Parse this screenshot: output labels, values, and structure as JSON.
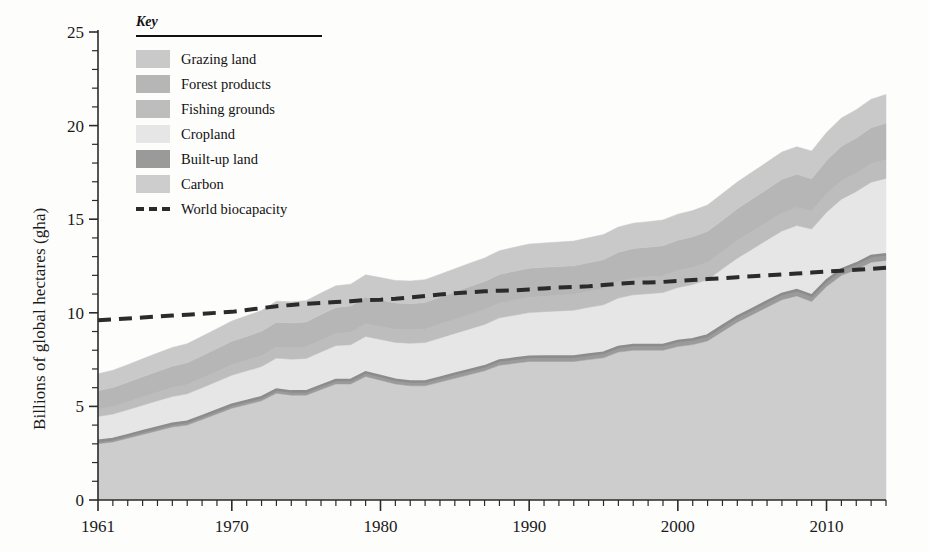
{
  "axes": {
    "ylabel": "Billions of global hectares (gha)",
    "yticks": [
      0,
      5,
      10,
      15,
      20,
      25
    ],
    "xticks": [
      1961,
      1970,
      1980,
      1990,
      2000,
      2010
    ]
  },
  "legend": {
    "title": "Key",
    "entries": [
      {
        "label": "Grazing land",
        "color": "#c9c9c9"
      },
      {
        "label": "Forest products",
        "color": "#b6b6b6"
      },
      {
        "label": "Fishing grounds",
        "color": "#bdbdbd"
      },
      {
        "label": "Cropland",
        "color": "#e6e6e6"
      },
      {
        "label": "Built-up land",
        "color": "#9a9a9a"
      },
      {
        "label": "Carbon",
        "color": "#cdcdcd"
      },
      {
        "label": "World biocapacity",
        "color": "#2b2b2b"
      }
    ]
  },
  "chart_data": {
    "type": "area",
    "title": "",
    "xlabel": "",
    "ylabel": "Billions of global hectares (gha)",
    "xlim": [
      1961,
      2014
    ],
    "ylim": [
      0,
      25
    ],
    "grid": false,
    "legend_position": "top-left",
    "stack_order": [
      "Carbon",
      "Built-up land",
      "Cropland",
      "Fishing grounds",
      "Forest products",
      "Grazing land"
    ],
    "x": [
      1961,
      1962,
      1963,
      1964,
      1965,
      1966,
      1967,
      1968,
      1969,
      1970,
      1971,
      1972,
      1973,
      1974,
      1975,
      1976,
      1977,
      1978,
      1979,
      1980,
      1981,
      1982,
      1983,
      1984,
      1985,
      1986,
      1987,
      1988,
      1989,
      1990,
      1991,
      1992,
      1993,
      1994,
      1995,
      1996,
      1997,
      1998,
      1999,
      2000,
      2001,
      2002,
      2003,
      2004,
      2005,
      2006,
      2007,
      2008,
      2009,
      2010,
      2011,
      2012,
      2013,
      2014
    ],
    "series": [
      {
        "name": "Carbon",
        "color": "#cdcdcd",
        "values": [
          3.0,
          3.1,
          3.3,
          3.5,
          3.7,
          3.9,
          4.0,
          4.3,
          4.6,
          4.9,
          5.1,
          5.3,
          5.7,
          5.6,
          5.6,
          5.9,
          6.2,
          6.2,
          6.6,
          6.4,
          6.2,
          6.1,
          6.1,
          6.3,
          6.5,
          6.7,
          6.9,
          7.2,
          7.3,
          7.4,
          7.4,
          7.4,
          7.4,
          7.5,
          7.6,
          7.9,
          8.0,
          8.0,
          8.0,
          8.2,
          8.3,
          8.5,
          9.0,
          9.5,
          9.9,
          10.3,
          10.7,
          10.9,
          10.6,
          11.4,
          12.0,
          12.3,
          12.7,
          12.8
        ]
      },
      {
        "name": "Built-up land",
        "color": "#9a9a9a",
        "values": [
          0.16,
          0.16,
          0.16,
          0.17,
          0.17,
          0.17,
          0.18,
          0.18,
          0.18,
          0.19,
          0.19,
          0.19,
          0.2,
          0.2,
          0.2,
          0.21,
          0.21,
          0.21,
          0.22,
          0.22,
          0.22,
          0.23,
          0.23,
          0.23,
          0.24,
          0.24,
          0.24,
          0.25,
          0.25,
          0.25,
          0.26,
          0.26,
          0.26,
          0.27,
          0.27,
          0.27,
          0.28,
          0.28,
          0.28,
          0.29,
          0.29,
          0.29,
          0.3,
          0.3,
          0.3,
          0.31,
          0.31,
          0.31,
          0.32,
          0.32,
          0.32,
          0.33,
          0.33,
          0.33
        ]
      },
      {
        "name": "Cropland",
        "color": "#e6e6e6",
        "values": [
          1.3,
          1.33,
          1.36,
          1.39,
          1.43,
          1.46,
          1.49,
          1.52,
          1.55,
          1.58,
          1.61,
          1.64,
          1.68,
          1.72,
          1.76,
          1.8,
          1.84,
          1.88,
          1.92,
          1.96,
          2.0,
          2.04,
          2.08,
          2.12,
          2.16,
          2.2,
          2.24,
          2.28,
          2.32,
          2.36,
          2.4,
          2.44,
          2.48,
          2.52,
          2.56,
          2.62,
          2.68,
          2.74,
          2.8,
          2.86,
          2.92,
          2.98,
          3.05,
          3.12,
          3.2,
          3.28,
          3.36,
          3.45,
          3.55,
          3.65,
          3.75,
          3.85,
          3.95,
          4.05
        ]
      },
      {
        "name": "Fishing grounds",
        "color": "#bdbdbd",
        "values": [
          0.38,
          0.4,
          0.42,
          0.44,
          0.46,
          0.48,
          0.5,
          0.52,
          0.54,
          0.56,
          0.57,
          0.58,
          0.59,
          0.61,
          0.62,
          0.64,
          0.65,
          0.67,
          0.68,
          0.69,
          0.7,
          0.72,
          0.73,
          0.75,
          0.76,
          0.78,
          0.79,
          0.8,
          0.81,
          0.82,
          0.83,
          0.84,
          0.85,
          0.86,
          0.87,
          0.88,
          0.89,
          0.9,
          0.9,
          0.91,
          0.92,
          0.93,
          0.93,
          0.94,
          0.95,
          0.95,
          0.96,
          0.96,
          0.97,
          0.97,
          0.98,
          0.98,
          0.99,
          1.0
        ]
      },
      {
        "name": "Forest products",
        "color": "#b6b6b6",
        "values": [
          1.0,
          1.02,
          1.05,
          1.08,
          1.11,
          1.14,
          1.16,
          1.19,
          1.22,
          1.25,
          1.27,
          1.3,
          1.33,
          1.33,
          1.33,
          1.36,
          1.38,
          1.4,
          1.43,
          1.42,
          1.41,
          1.4,
          1.41,
          1.43,
          1.45,
          1.48,
          1.5,
          1.52,
          1.54,
          1.55,
          1.54,
          1.53,
          1.52,
          1.53,
          1.54,
          1.56,
          1.58,
          1.58,
          1.6,
          1.62,
          1.63,
          1.65,
          1.67,
          1.7,
          1.73,
          1.76,
          1.8,
          1.78,
          1.72,
          1.8,
          1.85,
          1.88,
          1.92,
          1.95
        ]
      },
      {
        "name": "Grazing land",
        "color": "#c9c9c9",
        "values": [
          0.9,
          0.92,
          0.94,
          0.96,
          0.98,
          1.0,
          1.02,
          1.04,
          1.06,
          1.08,
          1.1,
          1.11,
          1.12,
          1.13,
          1.14,
          1.15,
          1.16,
          1.17,
          1.18,
          1.19,
          1.2,
          1.21,
          1.22,
          1.23,
          1.24,
          1.25,
          1.26,
          1.27,
          1.28,
          1.29,
          1.3,
          1.31,
          1.32,
          1.33,
          1.34,
          1.35,
          1.36,
          1.37,
          1.38,
          1.39,
          1.4,
          1.41,
          1.42,
          1.43,
          1.44,
          1.45,
          1.46,
          1.47,
          1.48,
          1.49,
          1.5,
          1.51,
          1.52,
          1.53
        ]
      }
    ],
    "reference_line": {
      "name": "World biocapacity",
      "style": "dashed",
      "color": "#2b2b2b",
      "values": [
        9.6,
        9.65,
        9.7,
        9.75,
        9.8,
        9.85,
        9.9,
        9.95,
        10.0,
        10.05,
        10.15,
        10.25,
        10.35,
        10.42,
        10.48,
        10.52,
        10.58,
        10.62,
        10.68,
        10.7,
        10.75,
        10.82,
        10.9,
        10.98,
        11.05,
        11.1,
        11.15,
        11.18,
        11.2,
        11.25,
        11.3,
        11.35,
        11.38,
        11.42,
        11.48,
        11.55,
        11.6,
        11.62,
        11.65,
        11.7,
        11.75,
        11.8,
        11.85,
        11.9,
        11.95,
        12.0,
        12.05,
        12.1,
        12.15,
        12.2,
        12.25,
        12.3,
        12.35,
        12.4
      ]
    }
  }
}
